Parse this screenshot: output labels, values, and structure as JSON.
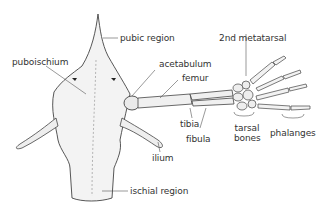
{
  "diagram": {
    "labels": {
      "pubic_region": "pubic region",
      "puboischium": "puboischium",
      "acetabulum": "acetabulum",
      "femur": "femur",
      "second_metatarsal": "2nd metatarsal",
      "tibia": "tibia",
      "fibula": "fibula",
      "tarsal_bones_line1": "tarsal",
      "tarsal_bones_line2": "bones",
      "phalanges": "phalanges",
      "ilium": "ilium",
      "ischial_region": "ischial region"
    },
    "colors": {
      "line": "#444444",
      "bone_fill": "#f2f2f2",
      "text": "#333333"
    }
  }
}
